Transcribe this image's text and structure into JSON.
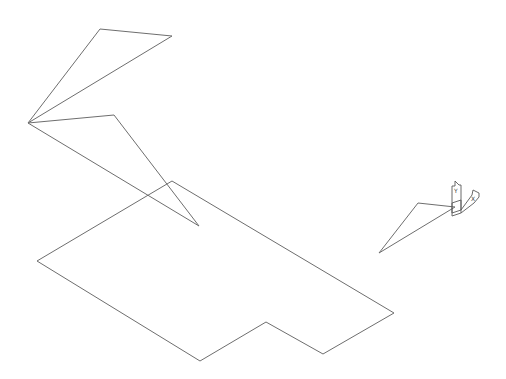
{
  "drawing": {
    "stroke_color": "#6e6e6e",
    "background": "#ffffff",
    "shapes": {
      "upper_triangle": "28,123 100,29 172,36",
      "middle_triangle": "28,123 114,115 199,226",
      "floor_polygon": "172,181 394,313 323,354 266,322 200,361 37,261",
      "small_triangle": "379,253 418,203 455,207"
    }
  },
  "ucs_icon": {
    "y_label": "Y",
    "x_label": "X"
  }
}
